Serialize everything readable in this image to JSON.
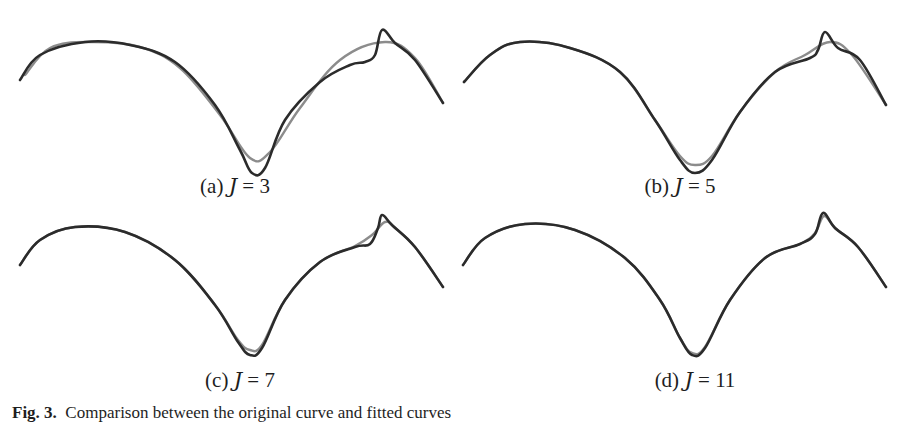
{
  "chart_data": [
    {
      "type": "line",
      "panel": "a",
      "title": "(a) J = 3",
      "label_prefix": "(a)",
      "label_var": "J",
      "label_value": "3",
      "J": 3,
      "series": [
        {
          "name": "original curve",
          "color": "#2b2b2b",
          "points": [
            [
              20,
              80
            ],
            [
              40,
              55
            ],
            [
              85,
              42
            ],
            [
              130,
              45
            ],
            [
              175,
              62
            ],
            [
              215,
              105
            ],
            [
              240,
              150
            ],
            [
              252,
              173
            ],
            [
              265,
              168
            ],
            [
              285,
              120
            ],
            [
              320,
              82
            ],
            [
              350,
              65
            ],
            [
              365,
              62
            ],
            [
              375,
              55
            ],
            [
              382,
              30
            ],
            [
              395,
              43
            ],
            [
              415,
              60
            ],
            [
              443,
              103
            ]
          ]
        },
        {
          "name": "fitted curve",
          "color": "#8c8c8c",
          "points": [
            [
              25,
              75
            ],
            [
              50,
              48
            ],
            [
              90,
              42
            ],
            [
              140,
              47
            ],
            [
              180,
              68
            ],
            [
              220,
              115
            ],
            [
              250,
              158
            ],
            [
              270,
              152
            ],
            [
              300,
              108
            ],
            [
              340,
              60
            ],
            [
              385,
              42
            ],
            [
              415,
              58
            ],
            [
              443,
              103
            ]
          ]
        }
      ]
    },
    {
      "type": "line",
      "panel": "b",
      "title": "(b) J = 5",
      "label_prefix": "(b)",
      "label_var": "J",
      "label_value": "5",
      "J": 5,
      "series": [
        {
          "name": "original curve",
          "color": "#2b2b2b",
          "points": [
            [
              464,
              82
            ],
            [
              490,
              55
            ],
            [
              520,
              42
            ],
            [
              570,
              48
            ],
            [
              620,
              72
            ],
            [
              655,
              120
            ],
            [
              680,
              160
            ],
            [
              695,
              173
            ],
            [
              712,
              160
            ],
            [
              740,
              112
            ],
            [
              775,
              72
            ],
            [
              810,
              58
            ],
            [
              818,
              50
            ],
            [
              825,
              32
            ],
            [
              838,
              48
            ],
            [
              860,
              60
            ],
            [
              886,
              105
            ]
          ]
        },
        {
          "name": "fitted curve",
          "color": "#8c8c8c",
          "points": [
            [
              464,
              82
            ],
            [
              490,
              55
            ],
            [
              520,
              42
            ],
            [
              570,
              48
            ],
            [
              620,
              72
            ],
            [
              655,
              120
            ],
            [
              680,
              156
            ],
            [
              695,
              165
            ],
            [
              712,
              156
            ],
            [
              740,
              112
            ],
            [
              775,
              72
            ],
            [
              805,
              55
            ],
            [
              830,
              42
            ],
            [
              852,
              55
            ],
            [
              886,
              105
            ]
          ]
        }
      ]
    },
    {
      "type": "line",
      "panel": "c",
      "title": "(c) J = 7",
      "label_prefix": "(c)",
      "label_var": "J",
      "label_value": "7",
      "J": 7,
      "series": [
        {
          "name": "original curve",
          "color": "#2b2b2b",
          "points": [
            [
              20,
              265
            ],
            [
              40,
              240
            ],
            [
              75,
              227
            ],
            [
              125,
              232
            ],
            [
              175,
              260
            ],
            [
              215,
              305
            ],
            [
              238,
              342
            ],
            [
              250,
              355
            ],
            [
              262,
              348
            ],
            [
              285,
              300
            ],
            [
              320,
              262
            ],
            [
              355,
              247
            ],
            [
              370,
              244
            ],
            [
              378,
              228
            ],
            [
              382,
              215
            ],
            [
              392,
              225
            ],
            [
              415,
              247
            ],
            [
              443,
              287
            ]
          ]
        },
        {
          "name": "fitted curve",
          "color": "#8c8c8c",
          "points": [
            [
              20,
              265
            ],
            [
              40,
              240
            ],
            [
              75,
              227
            ],
            [
              125,
              232
            ],
            [
              175,
              260
            ],
            [
              215,
              305
            ],
            [
              238,
              340
            ],
            [
              250,
              350
            ],
            [
              262,
              345
            ],
            [
              285,
              300
            ],
            [
              320,
              262
            ],
            [
              355,
              246
            ],
            [
              372,
              235
            ],
            [
              385,
              222
            ],
            [
              395,
              228
            ],
            [
              415,
              247
            ],
            [
              443,
              287
            ]
          ]
        }
      ]
    },
    {
      "type": "line",
      "panel": "d",
      "title": "(d) J = 11",
      "label_prefix": "(d)",
      "label_var": "J",
      "label_value": "11",
      "J": 11,
      "series": [
        {
          "name": "original curve",
          "color": "#2b2b2b",
          "points": [
            [
              463,
              265
            ],
            [
              485,
              238
            ],
            [
              525,
              224
            ],
            [
              575,
              230
            ],
            [
              625,
              258
            ],
            [
              660,
              300
            ],
            [
              680,
              338
            ],
            [
              692,
              355
            ],
            [
              705,
              348
            ],
            [
              730,
              300
            ],
            [
              765,
              258
            ],
            [
              800,
              244
            ],
            [
              815,
              234
            ],
            [
              823,
              213
            ],
            [
              835,
              228
            ],
            [
              858,
              247
            ],
            [
              886,
              287
            ]
          ]
        },
        {
          "name": "fitted curve",
          "color": "#8c8c8c",
          "points": [
            [
              463,
              265
            ],
            [
              485,
              238
            ],
            [
              525,
              224
            ],
            [
              575,
              230
            ],
            [
              625,
              258
            ],
            [
              660,
              300
            ],
            [
              680,
              338
            ],
            [
              692,
              353
            ],
            [
              705,
              347
            ],
            [
              730,
              300
            ],
            [
              765,
              258
            ],
            [
              800,
              244
            ],
            [
              815,
              233
            ],
            [
              824,
              216
            ],
            [
              835,
              228
            ],
            [
              858,
              247
            ],
            [
              886,
              287
            ]
          ]
        }
      ]
    }
  ],
  "caption": {
    "fig_label": "Fig. 3.",
    "text": "Comparison between the original curve and fitted curves"
  },
  "panels": {
    "a": {
      "prefix": "(a)",
      "var": "J",
      "eq": " = 3"
    },
    "b": {
      "prefix": "(b)",
      "var": "J",
      "eq": " = 5"
    },
    "c": {
      "prefix": "(c)",
      "var": "J",
      "eq": " = 7"
    },
    "d": {
      "prefix": "(d)",
      "var": "J",
      "eq": " = 11"
    }
  }
}
